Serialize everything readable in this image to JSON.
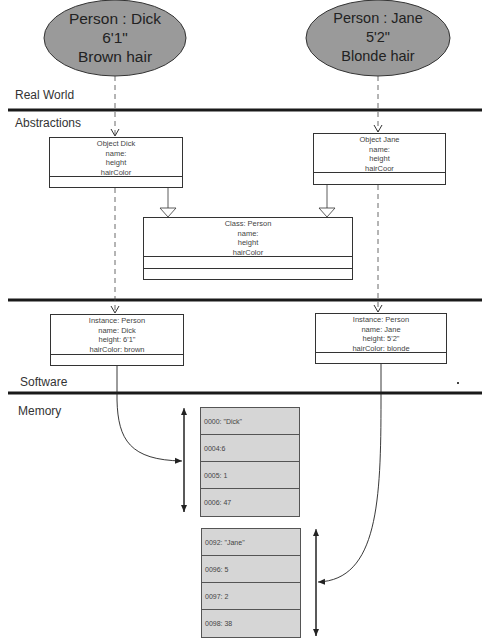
{
  "real_world": {
    "dick": {
      "lines": [
        "Person : Dick",
        "6'1\"",
        "Brown hair"
      ]
    },
    "jane": {
      "lines": [
        "Person : Jane",
        "5'2\"",
        "Blonde hair"
      ]
    }
  },
  "layers": {
    "real_world": "Real World",
    "abstractions": "Abstractions",
    "software": "Software",
    "memory": "Memory"
  },
  "abstractions": {
    "object_dick": [
      "Object Dick",
      "name:",
      "height",
      "hairColor"
    ],
    "object_jane": [
      "Object Jane",
      "name:",
      "height",
      "hairCoor"
    ],
    "class_person": [
      "Class: Person",
      "name:",
      "height",
      "hairColor"
    ]
  },
  "software": {
    "instance_dick": [
      "Instance: Person",
      "name: Dick",
      "height: 6'1\"",
      "hairColor: brown"
    ],
    "instance_jane": [
      "Instance: Person",
      "name: Jane",
      "height: 5'2\"",
      "hairColor: blonde"
    ]
  },
  "memory": {
    "dick_block": [
      "0000: \"Dick\"",
      "0004:6",
      "0005: 1",
      "0006: 47"
    ],
    "jane_block": [
      "0092: \"Jane\"",
      "0096: 5",
      "0097: 2",
      "0098: 38"
    ]
  },
  "colors": {
    "ellipse_fill": "#9a9a9a",
    "memory_fill": "#d6d6d6",
    "line": "#222222"
  }
}
